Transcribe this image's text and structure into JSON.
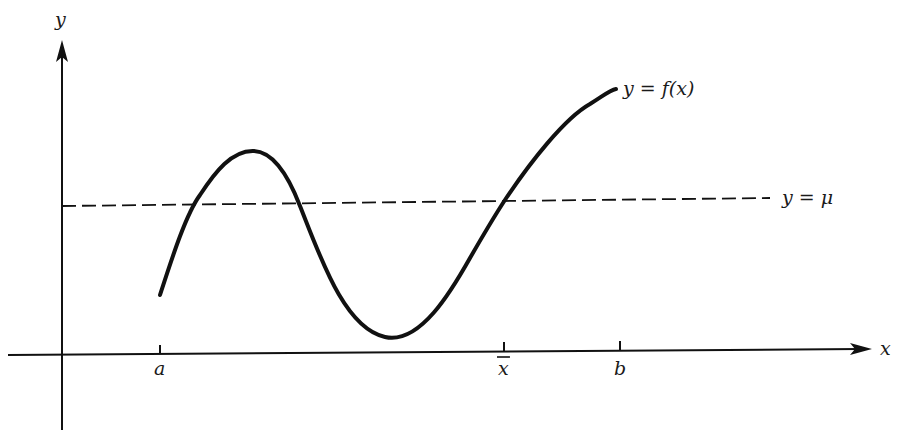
{
  "figure": {
    "axes": {
      "x_label": "x",
      "y_label": "y"
    },
    "curve_label": "y = f(x)",
    "mean_line_label": "y = μ",
    "ticks": [
      {
        "name": "a",
        "label": "a",
        "x": 160
      },
      {
        "name": "x-bar",
        "label": "x",
        "x": 503,
        "overbar": true
      },
      {
        "name": "b",
        "label": "b",
        "x": 620
      }
    ],
    "colors": {
      "ink": "#111111",
      "background": "#ffffff"
    }
  }
}
